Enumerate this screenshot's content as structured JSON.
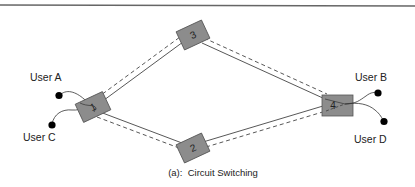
{
  "figure": {
    "caption": "(a):  Circuit Switching",
    "colors": {
      "node_fill": "#8c8c8c",
      "node_stroke": "#555555",
      "link": "#444444",
      "endpoint": "#000000",
      "top_rule": "#666666"
    }
  },
  "nodes": [
    {
      "id": "1",
      "label": "1"
    },
    {
      "id": "2",
      "label": "2"
    },
    {
      "id": "3",
      "label": "3"
    },
    {
      "id": "4",
      "label": "4"
    }
  ],
  "users": [
    {
      "id": "A",
      "label": "User A",
      "attached_to": "1"
    },
    {
      "id": "C",
      "label": "User C",
      "attached_to": "1"
    },
    {
      "id": "B",
      "label": "User B",
      "attached_to": "4"
    },
    {
      "id": "D",
      "label": "User D",
      "attached_to": "4"
    }
  ],
  "links": [
    {
      "from": "1",
      "to": "3",
      "styles": [
        "solid",
        "dashed"
      ]
    },
    {
      "from": "3",
      "to": "4",
      "styles": [
        "solid",
        "dashed"
      ]
    },
    {
      "from": "1",
      "to": "2",
      "styles": [
        "solid",
        "dashed"
      ]
    },
    {
      "from": "2",
      "to": "4",
      "styles": [
        "solid",
        "dashed"
      ]
    }
  ]
}
